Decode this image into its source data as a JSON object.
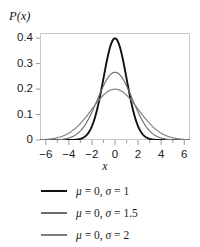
{
  "chart_data": {
    "type": "line",
    "title": "",
    "xlabel": "x",
    "ylabel": "P(x)",
    "xlim": [
      -6.5,
      6.5
    ],
    "ylim": [
      0,
      0.42
    ],
    "grid": false,
    "legend_position": "below",
    "x_tick_labels": [
      "−6",
      "−4",
      "−2",
      "0",
      "2",
      "4",
      "6"
    ],
    "x_tick_values": [
      -6,
      -4,
      -2,
      0,
      2,
      4,
      6
    ],
    "x_minor_tick_values": [
      -5,
      -3,
      -1,
      1,
      3,
      5
    ],
    "y_tick_labels": [
      "0.4",
      "0.3",
      "0.2",
      "0.1",
      "0"
    ],
    "y_tick_values": [
      0.4,
      0.3,
      0.2,
      0.1,
      0
    ],
    "series": [
      {
        "name": "μ = 0, σ = 1",
        "mu": 0,
        "sigma": 1,
        "color": "#111111",
        "width": 1.9,
        "peak": 0.399,
        "x": [
          -6.5,
          -6,
          -5.5,
          -5,
          -4.5,
          -4,
          -3.5,
          -3,
          -2.5,
          -2,
          -1.5,
          -1,
          -0.5,
          0,
          0.5,
          1,
          1.5,
          2,
          2.5,
          3,
          3.5,
          4,
          4.5,
          5,
          5.5,
          6,
          6.5
        ],
        "y": [
          0.0,
          0.0,
          0.0,
          0.0,
          0.0,
          0.0001,
          0.0009,
          0.0044,
          0.0175,
          0.054,
          0.1295,
          0.242,
          0.3521,
          0.3989,
          0.3521,
          0.242,
          0.1295,
          0.054,
          0.0175,
          0.0044,
          0.0009,
          0.0001,
          0.0,
          0.0,
          0.0,
          0.0,
          0.0
        ]
      },
      {
        "name": "μ = 0, σ = 1.5",
        "mu": 0,
        "sigma": 1.5,
        "color": "#6e6e6e",
        "width": 1.15,
        "peak": 0.266,
        "x": [
          -6.5,
          -6,
          -5.5,
          -5,
          -4.5,
          -4,
          -3.5,
          -3,
          -2.5,
          -2,
          -1.5,
          -1,
          -0.5,
          0,
          0.5,
          1,
          1.5,
          2,
          2.5,
          3,
          3.5,
          4,
          4.5,
          5,
          5.5,
          6,
          6.5
        ],
        "y": [
          0.0005,
          0.0012,
          0.0028,
          0.0061,
          0.0123,
          0.0228,
          0.039,
          0.0614,
          0.0891,
          0.1193,
          0.1476,
          0.1683,
          0.1772,
          0.1772,
          0.1772,
          0.1683,
          0.1476,
          0.1193,
          0.0891,
          0.0614,
          0.039,
          0.0228,
          0.0123,
          0.0061,
          0.0028,
          0.0012,
          0.0005
        ]
      },
      {
        "name": "μ = 0, σ = 2",
        "mu": 0,
        "sigma": 2,
        "color": "#7d7d7d",
        "width": 1.15,
        "peak": 0.199,
        "x": [
          -6.5,
          -6,
          -5.5,
          -5,
          -4.5,
          -4,
          -3.5,
          -3,
          -2.5,
          -2,
          -1.5,
          -1,
          -0.5,
          0,
          0.5,
          1,
          1.5,
          2,
          2.5,
          3,
          3.5,
          4,
          4.5,
          5,
          5.5,
          6,
          6.5
        ],
        "y": [
          0.0044,
          0.0065,
          0.0094,
          0.0131,
          0.0178,
          0.027,
          0.0336,
          0.043,
          0.0537,
          0.0648,
          0.0756,
          0.0855,
          0.0937,
          0.0997,
          0.0937,
          0.0855,
          0.0756,
          0.0648,
          0.0537,
          0.043,
          0.0336,
          0.027,
          0.0178,
          0.0131,
          0.0094,
          0.0065,
          0.0044
        ]
      }
    ]
  },
  "axes": {
    "ylabel": "P(x)",
    "xlabel": "x",
    "y_ticks": [
      {
        "label": "0.4"
      },
      {
        "label": "0.3"
      },
      {
        "label": "0.2"
      },
      {
        "label": "0.1"
      },
      {
        "label": "0"
      }
    ],
    "x_ticks": [
      {
        "label": "−6"
      },
      {
        "label": "−4"
      },
      {
        "label": "−2"
      },
      {
        "label": "0"
      },
      {
        "label": "2"
      },
      {
        "label": "4"
      },
      {
        "label": "6"
      }
    ]
  },
  "legend": {
    "entries": [
      {
        "label": "μ = 0, σ = 1",
        "color": "#111111"
      },
      {
        "label": "μ = 0, σ = 1.5",
        "color": "#6e6e6e"
      },
      {
        "label": "μ = 0, σ = 2",
        "color": "#7d7d7d"
      }
    ]
  },
  "colors": {
    "background": "#ffffff",
    "frame": "#c8c8c8",
    "text": "#1a1a1a"
  }
}
